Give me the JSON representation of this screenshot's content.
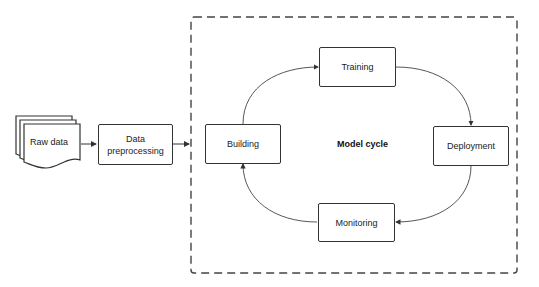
{
  "nodes": {
    "raw_data": "Raw data",
    "preprocessing_line1": "Data",
    "preprocessing_line2": "preprocessing",
    "building": "Building",
    "training": "Training",
    "deployment": "Deployment",
    "monitoring": "Monitoring"
  },
  "container": {
    "title": "Model cycle"
  },
  "edges": [
    {
      "from": "Raw data",
      "to": "Data preprocessing"
    },
    {
      "from": "Data preprocessing",
      "to": "Model cycle"
    },
    {
      "from": "Building",
      "to": "Training"
    },
    {
      "from": "Training",
      "to": "Deployment"
    },
    {
      "from": "Deployment",
      "to": "Monitoring"
    },
    {
      "from": "Monitoring",
      "to": "Building"
    }
  ]
}
